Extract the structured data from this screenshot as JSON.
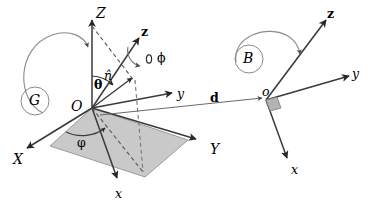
{
  "figure": {
    "background_color": "#ffffff",
    "line_color": "#333333",
    "dash_color": "#555555",
    "plane_fill": "#c8c8c8",
    "arc_color": "#777777"
  },
  "frames": {
    "global": {
      "name": "G",
      "origin_label": "O",
      "axes": [
        {
          "name": "Z-axis-label",
          "label": "Z",
          "x": 96,
          "y": 6
        },
        {
          "name": "X-axis-label",
          "label": "X",
          "x": 13,
          "y": 152
        },
        {
          "name": "Y-axis-label",
          "label": "Y",
          "x": 210,
          "y": 142
        }
      ],
      "body_axes": [
        {
          "name": "z-axis-label",
          "label": "z",
          "x": 141,
          "y": 26
        },
        {
          "name": "y-axis-label",
          "label": "y",
          "x": 177,
          "y": 88
        },
        {
          "name": "x-axis-label",
          "label": "x",
          "x": 115,
          "y": 188
        }
      ],
      "angles": [
        {
          "name": "theta",
          "label": "θ",
          "x": 94,
          "y": 79
        },
        {
          "name": "phi-azimuth",
          "label": "φ",
          "x": 77,
          "y": 137
        },
        {
          "name": "phi-spin",
          "label": "ϕ",
          "x": 155,
          "y": 54
        }
      ],
      "unit_normal": {
        "label": "n̂",
        "x": 106,
        "y": 72
      }
    },
    "body": {
      "name": "B",
      "origin_label": "o",
      "axes": [
        {
          "name": "z-axis-label",
          "label": "z",
          "x": 327,
          "y": 10
        },
        {
          "name": "y-axis-label",
          "label": "y",
          "x": 352,
          "y": 70
        },
        {
          "name": "x-axis-label",
          "label": "x",
          "x": 291,
          "y": 164
        }
      ]
    }
  },
  "vectors": [
    {
      "name": "displacement-vector",
      "label": "d",
      "x": 210,
      "y": 92
    }
  ],
  "frame_badges": [
    {
      "name": "frame-badge-G",
      "label": "G",
      "cx": 35,
      "cy": 101,
      "r": 14
    },
    {
      "name": "frame-badge-B",
      "label": "B",
      "cx": 249,
      "cy": 59,
      "r": 14
    }
  ]
}
